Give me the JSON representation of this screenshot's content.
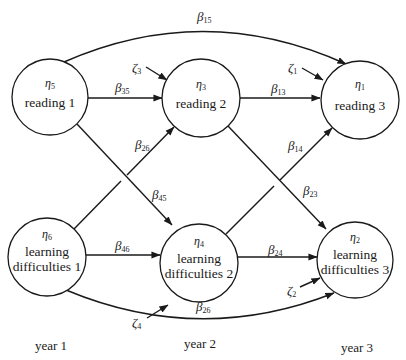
{
  "diagram": {
    "type": "path-diagram",
    "colors": {
      "ink": "#1a1a1a",
      "background": "#ffffff"
    },
    "nodes": [
      {
        "id": "eta5",
        "symbol": "η",
        "subscript": "5",
        "lines": [
          "reading 1"
        ],
        "cx": 50,
        "cy": 97,
        "r": 38
      },
      {
        "id": "eta3",
        "symbol": "η",
        "subscript": "3",
        "lines": [
          "reading 2"
        ],
        "cx": 201,
        "cy": 98,
        "r": 39
      },
      {
        "id": "eta1",
        "symbol": "η",
        "subscript": "1",
        "lines": [
          "reading 3"
        ],
        "cx": 360,
        "cy": 100,
        "r": 39
      },
      {
        "id": "eta6",
        "symbol": "η",
        "subscript": "6",
        "lines": [
          "learning",
          "difficulties 1"
        ],
        "cx": 47,
        "cy": 257,
        "r": 39
      },
      {
        "id": "eta4",
        "symbol": "η",
        "subscript": "4",
        "lines": [
          "learning",
          "difficulties 2"
        ],
        "cx": 199,
        "cy": 263,
        "r": 39
      },
      {
        "id": "eta2",
        "symbol": "η",
        "subscript": "2",
        "lines": [
          "learning",
          "difficulties 3"
        ],
        "cx": 355,
        "cy": 260,
        "r": 38
      }
    ],
    "paths": [
      {
        "from": "eta5",
        "to": "eta1",
        "symbol": "β",
        "subscript": "15"
      },
      {
        "from": "eta5",
        "to": "eta3",
        "symbol": "β",
        "subscript": "35"
      },
      {
        "from": "eta3",
        "to": "eta1",
        "symbol": "β",
        "subscript": "13"
      },
      {
        "from": "eta6",
        "to": "eta3",
        "symbol": "β",
        "subscript": "26"
      },
      {
        "from": "eta4",
        "to": "eta1",
        "symbol": "β",
        "subscript": "14"
      },
      {
        "from": "eta5",
        "to": "eta4",
        "symbol": "β",
        "subscript": "45"
      },
      {
        "from": "eta3",
        "to": "eta2",
        "symbol": "β",
        "subscript": "23"
      },
      {
        "from": "eta6",
        "to": "eta4",
        "symbol": "β",
        "subscript": "46"
      },
      {
        "from": "eta4",
        "to": "eta2",
        "symbol": "β",
        "subscript": "24"
      },
      {
        "from": "eta6",
        "to": "eta2",
        "symbol": "β",
        "subscript": "26"
      }
    ],
    "disturbances": [
      {
        "to": "eta3",
        "symbol": "ζ",
        "subscript": "3"
      },
      {
        "to": "eta1",
        "symbol": "ζ",
        "subscript": "1"
      },
      {
        "to": "eta4",
        "symbol": "ζ",
        "subscript": "4"
      },
      {
        "to": "eta2",
        "symbol": "ζ",
        "subscript": "2"
      }
    ],
    "time_labels": [
      "year 1",
      "year 2",
      "year 3"
    ]
  }
}
